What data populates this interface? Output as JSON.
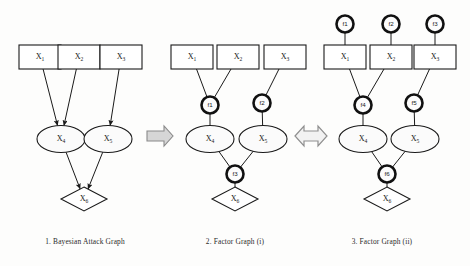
{
  "figure": {
    "width": 470,
    "height": 266,
    "background": "#fdfdfc",
    "ink": "#1a1a1a"
  },
  "panels": [
    {
      "id": "panel-1",
      "caption": "1. Bayesian Attack Graph",
      "caption_x": 85,
      "boxes": [
        {
          "name": "x1",
          "label": "X",
          "sub": "1",
          "cx": 40,
          "cy": 57
        },
        {
          "name": "x2",
          "label": "X",
          "sub": "2",
          "cx": 79,
          "cy": 57
        },
        {
          "name": "x3",
          "label": "X",
          "sub": "3",
          "cx": 121,
          "cy": 57
        }
      ],
      "ellipses": [
        {
          "name": "x4",
          "label": "X",
          "sub": "4",
          "cx": 61,
          "cy": 139
        },
        {
          "name": "x5",
          "label": "X",
          "sub": "5",
          "cx": 108,
          "cy": 139
        }
      ],
      "diamonds": [
        {
          "name": "x6",
          "label": "X",
          "sub": "6",
          "cx": 84,
          "cy": 199
        }
      ],
      "factors": [],
      "edges": [
        {
          "from": "x1",
          "to": "x4",
          "arrow": true
        },
        {
          "from": "x2",
          "to": "x4",
          "arrow": true
        },
        {
          "from": "x3",
          "to": "x5",
          "arrow": true
        },
        {
          "from": "x4",
          "to": "x6",
          "arrow": true
        },
        {
          "from": "x5",
          "to": "x6",
          "arrow": true
        }
      ]
    },
    {
      "id": "panel-2",
      "caption": "2. Factor Graph (i)",
      "caption_x": 235,
      "boxes": [
        {
          "name": "x1",
          "label": "X",
          "sub": "1",
          "cx": 192,
          "cy": 57
        },
        {
          "name": "x2",
          "label": "X",
          "sub": "2",
          "cx": 238,
          "cy": 57
        },
        {
          "name": "x3",
          "label": "X",
          "sub": "3",
          "cx": 285,
          "cy": 57
        }
      ],
      "ellipses": [
        {
          "name": "x4",
          "label": "X",
          "sub": "4",
          "cx": 210,
          "cy": 139
        },
        {
          "name": "x5",
          "label": "X",
          "sub": "5",
          "cx": 263,
          "cy": 139
        }
      ],
      "diamonds": [
        {
          "name": "x6",
          "label": "X",
          "sub": "6",
          "cx": 235,
          "cy": 199
        }
      ],
      "factors": [
        {
          "name": "f1",
          "label": "f1",
          "cx": 210,
          "cy": 105
        },
        {
          "name": "f2",
          "label": "f2",
          "cx": 262,
          "cy": 103
        },
        {
          "name": "f3",
          "label": "f3",
          "cx": 235,
          "cy": 174
        }
      ],
      "edges": [
        {
          "from": "x1",
          "to": "f1",
          "arrow": false
        },
        {
          "from": "x2",
          "to": "f1",
          "arrow": false
        },
        {
          "from": "x3",
          "to": "f2",
          "arrow": false
        },
        {
          "from": "f1",
          "to": "x4",
          "arrow": false
        },
        {
          "from": "f2",
          "to": "x5",
          "arrow": false
        },
        {
          "from": "x4",
          "to": "f3",
          "arrow": false
        },
        {
          "from": "x5",
          "to": "f3",
          "arrow": false
        },
        {
          "from": "f3",
          "to": "x6",
          "arrow": false
        }
      ]
    },
    {
      "id": "panel-3",
      "caption": "3. Factor Graph (ii)",
      "caption_x": 382,
      "boxes": [
        {
          "name": "x1",
          "label": "X",
          "sub": "1",
          "cx": 345,
          "cy": 57
        },
        {
          "name": "x2",
          "label": "X",
          "sub": "2",
          "cx": 391,
          "cy": 57
        },
        {
          "name": "x3",
          "label": "X",
          "sub": "3",
          "cx": 435,
          "cy": 57
        }
      ],
      "ellipses": [
        {
          "name": "x4",
          "label": "X",
          "sub": "4",
          "cx": 363,
          "cy": 139
        },
        {
          "name": "x5",
          "label": "X",
          "sub": "5",
          "cx": 415,
          "cy": 139
        }
      ],
      "diamonds": [
        {
          "name": "x6",
          "label": "X",
          "sub": "6",
          "cx": 387,
          "cy": 199
        }
      ],
      "factors": [
        {
          "name": "f1",
          "label": "f1",
          "cx": 345,
          "cy": 24
        },
        {
          "name": "f2",
          "label": "f2",
          "cx": 391,
          "cy": 24
        },
        {
          "name": "f3",
          "label": "f3",
          "cx": 435,
          "cy": 24
        },
        {
          "name": "f4",
          "label": "f4",
          "cx": 363,
          "cy": 105
        },
        {
          "name": "f5",
          "label": "f5",
          "cx": 414,
          "cy": 103
        },
        {
          "name": "f6",
          "label": "f6",
          "cx": 387,
          "cy": 174
        }
      ],
      "edges": [
        {
          "from": "f1",
          "to": "x1",
          "arrow": false
        },
        {
          "from": "f2",
          "to": "x2",
          "arrow": false
        },
        {
          "from": "f3",
          "to": "x3",
          "arrow": false
        },
        {
          "from": "x1",
          "to": "f4",
          "arrow": false
        },
        {
          "from": "x2",
          "to": "f4",
          "arrow": false
        },
        {
          "from": "x3",
          "to": "f5",
          "arrow": false
        },
        {
          "from": "f4",
          "to": "x4",
          "arrow": false
        },
        {
          "from": "f5",
          "to": "x5",
          "arrow": false
        },
        {
          "from": "x4",
          "to": "f6",
          "arrow": false
        },
        {
          "from": "x5",
          "to": "f6",
          "arrow": false
        },
        {
          "from": "f6",
          "to": "x6",
          "arrow": false
        }
      ]
    }
  ],
  "connectors": [
    {
      "name": "transform-arrow-right",
      "type": "arrow-right",
      "cx": 160,
      "cy": 136,
      "fill": "#d6d6d6"
    },
    {
      "name": "equivalence-arrow-double",
      "type": "arrow-double",
      "cx": 311,
      "cy": 136,
      "fill": "#f2f2f2"
    }
  ],
  "caption_y": 244
}
